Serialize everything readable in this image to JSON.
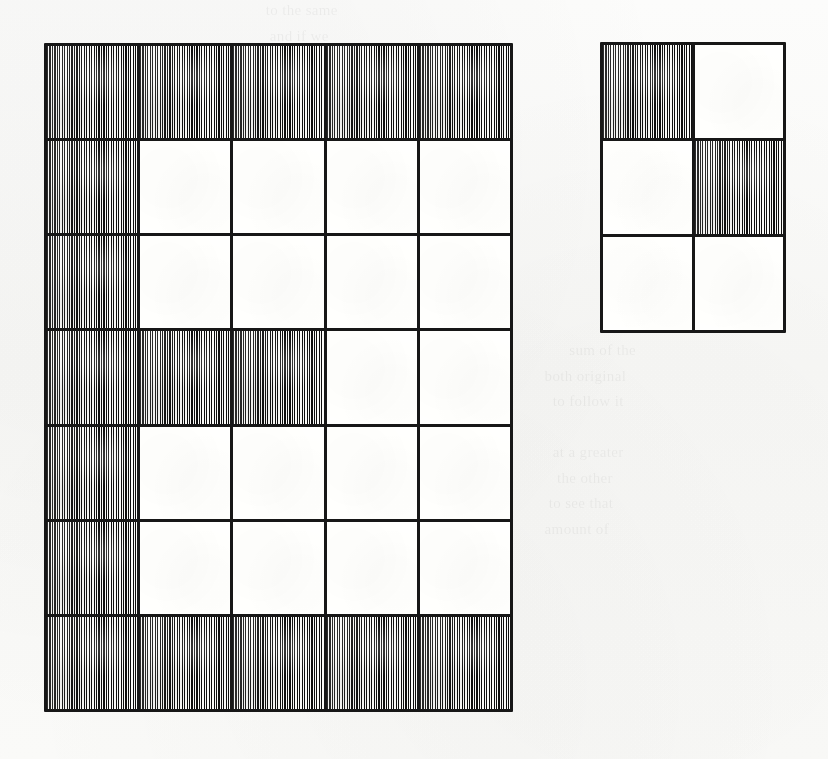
{
  "figure": {
    "background_color": "#fbfbfa",
    "ink_color": "#1b1b1b",
    "hatch_color": "#111111",
    "blank_cell_color": "#fbfbf9"
  },
  "ghost_text": {
    "top_block": "                 to the same\n                  and if we\n\n              the hatched\n              the figure\n              is that of\n                 to hatch\n               the other\n          a very small",
    "right_block": "            sum of the\n      both original\n        to follow it\n\n        at a greater\n         the other\n       to see that\n      amount of"
  },
  "grids": [
    {
      "id": "grid-large",
      "name": "large-grid",
      "columns": 5,
      "rows": 7,
      "cells": [
        [
          1,
          1,
          1,
          1,
          1
        ],
        [
          1,
          0,
          0,
          0,
          0
        ],
        [
          1,
          0,
          0,
          0,
          0
        ],
        [
          1,
          1,
          1,
          0,
          0
        ],
        [
          1,
          0,
          0,
          0,
          0
        ],
        [
          1,
          0,
          0,
          0,
          0
        ],
        [
          1,
          1,
          1,
          1,
          1
        ]
      ],
      "shaded_count": 19,
      "total_count": 35,
      "hatch_style": "vertical-line-ruling"
    },
    {
      "id": "grid-small",
      "name": "small-grid",
      "columns": 2,
      "rows": 3,
      "cells": [
        [
          1,
          0
        ],
        [
          0,
          1
        ],
        [
          0,
          0
        ]
      ],
      "shaded_count": 2,
      "total_count": 6,
      "hatch_style": "vertical-line-ruling"
    }
  ]
}
